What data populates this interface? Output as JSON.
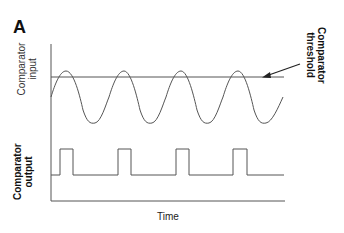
{
  "figure": {
    "panel_label": "A",
    "labels": {
      "comparator_input_line1": "Comparator",
      "comparator_input_line2": "input",
      "comparator_output_line1": "Comparator",
      "comparator_output_line2": "output",
      "threshold_line1": "Comparator",
      "threshold_line2": "threshold",
      "x_axis": "Time"
    },
    "colors": {
      "stroke": "#555555",
      "arrow": "#222222",
      "text": "#111111"
    }
  }
}
